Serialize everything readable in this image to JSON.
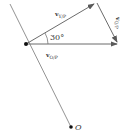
{
  "diagram": {
    "angle_label": "30°",
    "vectors": [
      {
        "name": "v",
        "subscript": "Y/P",
        "role": "upper-diagonal"
      },
      {
        "name": "v",
        "subscript": "O/P",
        "role": "horizontal"
      },
      {
        "name": "v",
        "subscript": "Q/P",
        "role": "right-side"
      }
    ],
    "points": [
      {
        "label": "O"
      }
    ],
    "colors": {
      "line": "#5a5a5a",
      "text": "#333333"
    }
  }
}
